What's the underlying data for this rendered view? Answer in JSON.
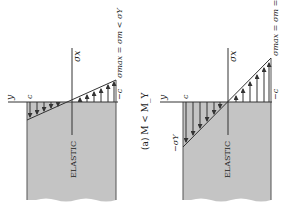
{
  "figure": {
    "caption": "(a) M < M_Y",
    "orientation": "rotated 90° counter-clockwise",
    "colors": {
      "section_fill": "#c4c4c4",
      "line": "#333333",
      "background": "#ffffff"
    }
  },
  "panels": [
    {
      "region_label": "ELASTIC",
      "axis_y_label": "y",
      "axis_x_label": "σx",
      "top_label": "c",
      "bottom_label": "−c",
      "equation": "σmax = σm < σY",
      "side_label": ""
    },
    {
      "region_label": "ELASTIC",
      "axis_y_label": "y",
      "axis_x_label": "σx",
      "top_label": "c",
      "bottom_label": "−c",
      "equation": "σmax = σm = σY",
      "side_label": "−σY"
    }
  ]
}
